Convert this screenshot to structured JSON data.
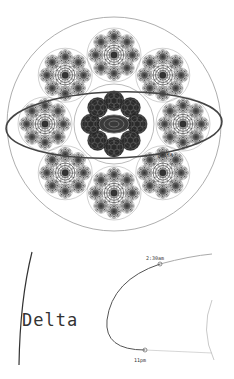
{
  "figure": {
    "type": "fractal-circle-diagram",
    "ellipse_label": "Delta",
    "detail": {
      "title": "Delta",
      "time_labels": [
        "2:30am",
        "11pm"
      ]
    }
  },
  "geometry": {
    "outer_circle": {
      "cx": 114,
      "cy": 124,
      "r": 107
    },
    "center_cluster": {
      "cx": 114,
      "cy": 124,
      "r": 40
    },
    "satellites": {
      "count": 8,
      "distance": 69,
      "r": 27
    },
    "ellipse": {
      "cx": 114,
      "cy": 125,
      "rx": 108,
      "ry": 33,
      "rotate": -2
    }
  },
  "colors": {
    "stroke": "#555555",
    "dark": "#222222",
    "light": "#999999",
    "background": "#ffffff"
  }
}
